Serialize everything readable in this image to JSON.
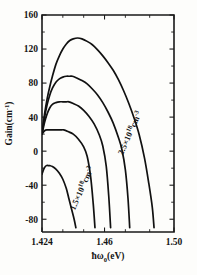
{
  "chart_data": {
    "type": "line",
    "title": "",
    "xlabel": "ħω₀(eV)",
    "ylabel": "Gain(cm⁻¹)",
    "xlim": [
      1.424,
      1.5
    ],
    "ylim": [
      -95,
      160
    ],
    "grid": false,
    "legend_position": "inline-annotations",
    "xticks": [
      1.424,
      1.46,
      1.5
    ],
    "xtick_labels": [
      "1.424",
      "1.46",
      "1.50"
    ],
    "yticks": [
      -80,
      -40,
      0,
      40,
      80,
      120,
      160
    ],
    "ytick_labels": [
      "-80",
      "-40",
      "0",
      "40",
      "80",
      "120",
      "160"
    ],
    "annotations": [
      {
        "text": "2.5×10¹⁸cm⁻³",
        "series": "2.5e18",
        "x": 1.476,
        "y": 20,
        "rotation": -66
      },
      {
        "text": "1.5×10¹⁸cm⁻³",
        "series": "1.5e18",
        "x": 1.4345,
        "y": -45,
        "rotation": -66
      }
    ],
    "series": [
      {
        "name": "2.5×10¹⁸cm⁻³",
        "carrier_density": "2.5e18",
        "peak_x": 1.4445,
        "peak_y": 133,
        "x": [
          1.424,
          1.4255,
          1.427,
          1.4285,
          1.43,
          1.432,
          1.434,
          1.436,
          1.438,
          1.44,
          1.442,
          1.4445,
          1.447,
          1.45,
          1.453,
          1.456,
          1.459,
          1.462,
          1.465,
          1.468,
          1.471,
          1.474,
          1.477,
          1.48,
          1.483,
          1.4855,
          1.4875,
          1.4885
        ],
        "y": [
          20,
          44,
          62,
          76,
          88,
          102,
          112,
          120,
          126,
          130,
          132,
          133,
          132,
          129,
          125,
          119,
          112,
          104,
          95,
          84,
          71,
          56,
          39,
          19,
          -8,
          -38,
          -66,
          -90
        ]
      },
      {
        "name": "curve-4",
        "carrier_density": "2.25e18",
        "peak_x": 1.4415,
        "peak_y": 88,
        "x": [
          1.424,
          1.4255,
          1.427,
          1.4285,
          1.43,
          1.432,
          1.434,
          1.436,
          1.438,
          1.44,
          1.4415,
          1.444,
          1.447,
          1.45,
          1.453,
          1.456,
          1.459,
          1.462,
          1.465,
          1.468,
          1.47,
          1.472,
          1.4735,
          1.4745
        ],
        "y": [
          20,
          40,
          55,
          66,
          74,
          81,
          85,
          87,
          88,
          88,
          88,
          86,
          83,
          79,
          73,
          66,
          57,
          46,
          33,
          16,
          2,
          -22,
          -55,
          -90
        ]
      },
      {
        "name": "curve-3",
        "carrier_density": "2.0e18",
        "peak_x": 1.4395,
        "peak_y": 58,
        "x": [
          1.424,
          1.4255,
          1.427,
          1.4285,
          1.43,
          1.432,
          1.434,
          1.436,
          1.438,
          1.4395,
          1.442,
          1.445,
          1.448,
          1.451,
          1.454,
          1.457,
          1.459,
          1.461,
          1.4625,
          1.4635
        ],
        "y": [
          20,
          34,
          44,
          51,
          55,
          57,
          58,
          58,
          58,
          58,
          56,
          53,
          48,
          41,
          32,
          19,
          6,
          -18,
          -55,
          -90
        ]
      },
      {
        "name": "curve-2",
        "carrier_density": "1.75e18",
        "peak_x": 1.4365,
        "peak_y": 25,
        "x": [
          1.424,
          1.4255,
          1.427,
          1.429,
          1.431,
          1.433,
          1.435,
          1.4365,
          1.439,
          1.442,
          1.445,
          1.448,
          1.45,
          1.452,
          1.4535,
          1.4545
        ],
        "y": [
          20,
          24,
          25,
          25,
          25,
          25,
          25,
          25,
          23,
          20,
          14,
          5,
          -6,
          -30,
          -62,
          -90
        ]
      },
      {
        "name": "1.5×10¹⁸cm⁻³",
        "carrier_density": "1.5e18",
        "peak_x": 1.4285,
        "peak_y": -17,
        "x": [
          1.424,
          1.4253,
          1.4265,
          1.428,
          1.4285,
          1.43,
          1.432,
          1.434,
          1.436,
          1.438,
          1.4395,
          1.441,
          1.4425,
          1.4435
        ],
        "y": [
          -27,
          -20,
          -17,
          -17,
          -17,
          -18,
          -21,
          -26,
          -33,
          -44,
          -56,
          -68,
          -80,
          -90
        ]
      }
    ]
  },
  "axis": {
    "x_title": "ħω₀(eV)",
    "x_title_main": "ħω",
    "x_title_sub": "0",
    "x_title_unit": "(eV)",
    "y_title_main": "Gain(cm",
    "y_title_sup": "-1",
    "y_title_close": ")"
  },
  "annotation_labels": {
    "upper_main": "2.5×10",
    "upper_sup": "18",
    "upper_unit": "cm",
    "upper_unit_sup": "-3",
    "lower_main": "1.5×10",
    "lower_sup": "18",
    "lower_unit": "cm",
    "lower_unit_sup": "-3"
  },
  "colors": {
    "curve": "#111111",
    "axis": "#1a1a1a",
    "background": "#fdfdfb"
  }
}
